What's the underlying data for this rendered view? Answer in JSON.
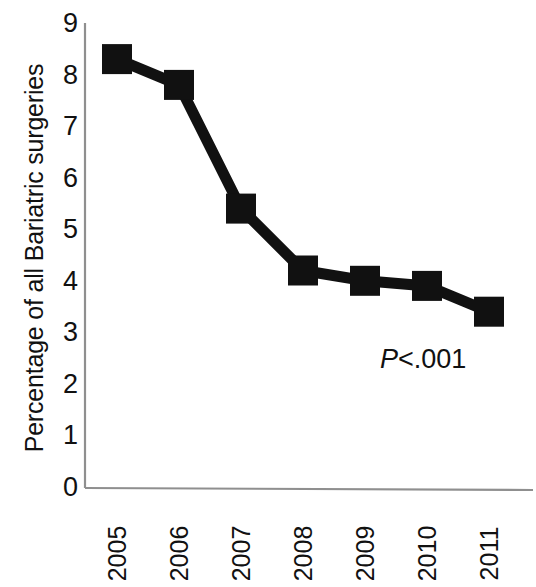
{
  "chart_data": {
    "type": "line",
    "title": "",
    "subtitle": "",
    "xlabel": "",
    "ylabel": "Percentage of all Bariatric surgeries",
    "categories": [
      "2005",
      "2006",
      "2007",
      "2008",
      "2009",
      "2010",
      "2011"
    ],
    "values": [
      8.3,
      7.8,
      5.4,
      4.2,
      4.0,
      3.9,
      3.4
    ],
    "series": [
      {
        "name": "Percentage of all Bariatric surgeries",
        "values": [
          8.3,
          7.8,
          5.4,
          4.2,
          4.0,
          3.9,
          3.4
        ]
      }
    ],
    "ylim": [
      0,
      9
    ],
    "ytick_labels": [
      "9",
      "8",
      "7",
      "6",
      "5",
      "4",
      "3",
      "2",
      "1",
      "0"
    ],
    "ytick_values": [
      9,
      8,
      7,
      6,
      5,
      4,
      3,
      2,
      1,
      0
    ],
    "xtick_labels": [
      "2005",
      "2006",
      "2007",
      "2008",
      "2009",
      "2010",
      "2011"
    ],
    "grid": false,
    "legend": "none",
    "legend_position": "none",
    "marker": "square",
    "marker_color": "#111111",
    "line_color": "#111111",
    "axis_color": "#8a8a8a",
    "background_color": "#ffffff",
    "annotations": [
      {
        "name": "p-value",
        "text": "P<.001",
        "italic_part": "P",
        "rest_part": "<.001"
      }
    ]
  },
  "axes": {
    "y_title": "Percentage of all Bariatric surgeries"
  }
}
